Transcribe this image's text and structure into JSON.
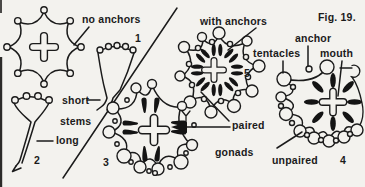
{
  "figure": {
    "caption": "Fig. 19."
  },
  "labels": {
    "no_anchors": "no anchors",
    "with_anchors": "with anchors",
    "tentacles": "tentacles",
    "anchor": "anchor",
    "mouth": "mouth",
    "short": "short",
    "stems": "stems",
    "long": "long",
    "paired": "paired",
    "gonads": "gonads",
    "unpaired": "unpaired"
  },
  "numbers": {
    "n1": "1",
    "n2": "2",
    "n3": "3",
    "n4": "4",
    "n5": "5"
  },
  "colors": {
    "ink": "#1b1b1b",
    "paper": "#f3f2ee"
  }
}
